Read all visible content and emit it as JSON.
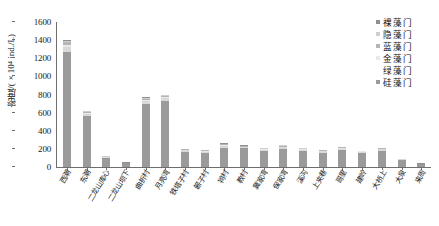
{
  "chart_data": {
    "type": "bar",
    "stacked": true,
    "title": "",
    "xlabel": "",
    "ylabel": "密度/(×10⁴ ind./L)",
    "ylim": [
      0,
      1600
    ],
    "yticks": [
      0,
      200,
      400,
      600,
      800,
      1000,
      1200,
      1400,
      1600
    ],
    "grid": false,
    "legend_position": "top-right",
    "categories": [
      "西潮",
      "东潮",
      "二龙山库心",
      "二龙山坝下",
      "曲折村",
      "月亮湾",
      "铁塔子村",
      "簖子村",
      "鸨村",
      "教村",
      "冀家湾",
      "保家湾",
      "溪沟",
      "上夹巷",
      "哥里",
      "建岭",
      "大桥上",
      "大泉",
      "来周"
    ],
    "series": [
      {
        "name": "硅藻门",
        "color": "#9a9a9a",
        "values": [
          1265,
          565,
          95,
          40,
          700,
          730,
          170,
          155,
          215,
          205,
          175,
          200,
          175,
          160,
          190,
          155,
          180,
          75,
          30
        ]
      },
      {
        "name": "绿藻门",
        "color": "#d9d9d9",
        "values": [
          55,
          25,
          10,
          5,
          30,
          30,
          15,
          15,
          20,
          15,
          15,
          18,
          15,
          12,
          14,
          12,
          14,
          8,
          4
        ]
      },
      {
        "name": "金藻门",
        "color": "#e8e8e8",
        "values": [
          25,
          10,
          4,
          2,
          12,
          12,
          6,
          6,
          8,
          6,
          6,
          7,
          6,
          5,
          6,
          5,
          6,
          3,
          2
        ]
      },
      {
        "name": "蓝藻门",
        "color": "#b5b5b5",
        "values": [
          30,
          12,
          5,
          2,
          14,
          14,
          7,
          7,
          9,
          7,
          7,
          8,
          7,
          6,
          7,
          6,
          7,
          3,
          2
        ]
      },
      {
        "name": "隐藻门",
        "color": "#cfcfcf",
        "values": [
          18,
          6,
          3,
          1,
          8,
          8,
          4,
          4,
          5,
          4,
          4,
          5,
          4,
          3,
          4,
          3,
          4,
          2,
          1
        ]
      },
      {
        "name": "裸藻门",
        "color": "#8f8f8f",
        "values": [
          7,
          2,
          1,
          1,
          4,
          4,
          2,
          2,
          3,
          2,
          2,
          2,
          2,
          1,
          2,
          1,
          2,
          1,
          1
        ]
      }
    ],
    "totals": [
      1400,
      620,
      118,
      51,
      768,
      798,
      204,
      189,
      260,
      239,
      209,
      240,
      209,
      187,
      223,
      182,
      213,
      92,
      40
    ]
  },
  "legend": {
    "items": [
      {
        "label": "裸藻门",
        "color": "#8f8f8f"
      },
      {
        "label": "隐藻门",
        "color": "#cfcfcf"
      },
      {
        "label": "蓝藻门",
        "color": "#b5b5b5"
      },
      {
        "label": "金藻门",
        "color": "#e8e8e8"
      },
      {
        "label": "绿藻门",
        "color": "#ffffff"
      },
      {
        "label": "硅藻门",
        "color": "#9a9a9a"
      }
    ]
  },
  "axis": {
    "y_title": "密度/(×10⁴ ind./L)",
    "tick_labels": [
      "1600",
      "1400",
      "1200",
      "1000",
      "800",
      "600",
      "400",
      "200",
      "0"
    ]
  }
}
